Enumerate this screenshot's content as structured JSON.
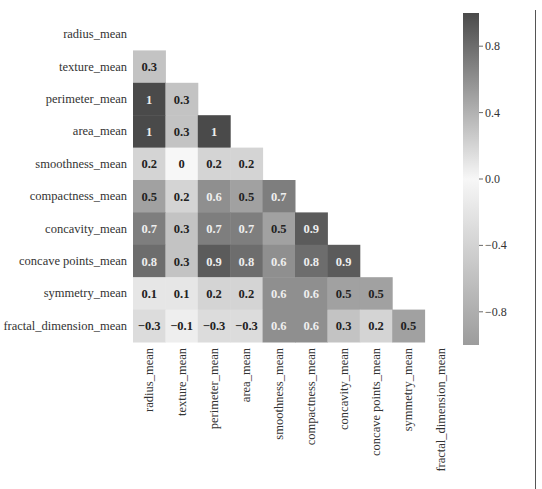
{
  "chart_data": {
    "type": "heatmap",
    "title": "",
    "xlabel": "",
    "ylabel": "",
    "mask": "upper_triangle_including_diagonal",
    "colormap": "diverging_grayscale",
    "vmin": -1,
    "vmax": 1,
    "labels": [
      "radius_mean",
      "texture_mean",
      "perimeter_mean",
      "area_mean",
      "smoothness_mean",
      "compactness_mean",
      "concavity_mean",
      "concave points_mean",
      "symmetry_mean",
      "fractal_dimension_mean"
    ],
    "values": [
      [],
      [
        0.3
      ],
      [
        1,
        0.3
      ],
      [
        1,
        0.3,
        1
      ],
      [
        0.2,
        0,
        0.2,
        0.2
      ],
      [
        0.5,
        0.2,
        0.6,
        0.5,
        0.7
      ],
      [
        0.7,
        0.3,
        0.7,
        0.7,
        0.5,
        0.9
      ],
      [
        0.8,
        0.3,
        0.9,
        0.8,
        0.6,
        0.8,
        0.9
      ],
      [
        0.1,
        0.1,
        0.2,
        0.2,
        0.6,
        0.6,
        0.5,
        0.5
      ],
      [
        -0.3,
        -0.1,
        -0.3,
        -0.3,
        0.6,
        0.6,
        0.3,
        0.2,
        0.5
      ]
    ],
    "colorbar": {
      "ticks": [
        0.8,
        0.4,
        0.0,
        -0.4,
        -0.8
      ],
      "tick_labels": [
        "0.8",
        "0.4",
        "0.0",
        "−0.4",
        "−0.8"
      ],
      "range": [
        -1,
        1
      ]
    },
    "grid": false,
    "legend_position": "right"
  },
  "colors": {
    "high": "#4a4a4a",
    "mid": "#f7f7f7",
    "low": "#9c9c9c",
    "text_dark": "#222222",
    "text_light": "#eeeeee",
    "axis_text": "#333333"
  }
}
